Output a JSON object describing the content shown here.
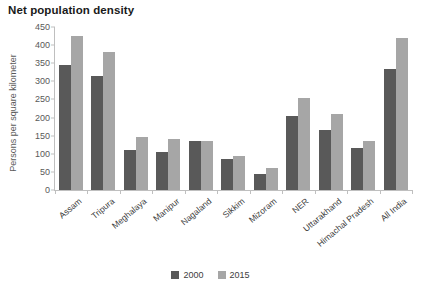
{
  "chart_data": {
    "type": "bar",
    "title": "Net population density",
    "xlabel": "",
    "ylabel": "Persons per square kilometer",
    "ylim": [
      0,
      450
    ],
    "yticks": [
      0,
      50,
      100,
      150,
      200,
      250,
      300,
      350,
      400,
      450
    ],
    "grid": false,
    "legend_position": "bottom",
    "categories": [
      "Assam",
      "Tripura",
      "Meghalaya",
      "Manipur",
      "Nagaland",
      "Sikkim",
      "Mizoram",
      "NER",
      "Uttarakhand",
      "Himachal Pradesh",
      "All India"
    ],
    "series": [
      {
        "name": "2000",
        "color": "#595959",
        "values": [
          345,
          315,
          110,
          105,
          135,
          85,
          45,
          205,
          165,
          115,
          335
        ]
      },
      {
        "name": "2015",
        "color": "#a6a6a6",
        "values": [
          425,
          380,
          147,
          142,
          135,
          95,
          62,
          255,
          210,
          135,
          420
        ]
      }
    ]
  }
}
